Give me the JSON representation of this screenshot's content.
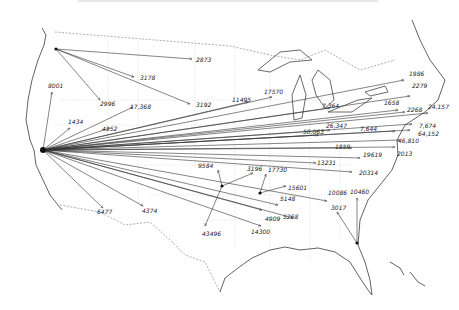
{
  "map": {
    "title": "",
    "description": "Hand-drawn flow map of the United States showing migration/shipment arrows from origins with numeric counts",
    "colors": {
      "ink": "#333333",
      "coast": "#3a3a3a",
      "state_lines": "#cfcfcf",
      "background": "#ffffff"
    },
    "origins": [
      {
        "name": "Seattle",
        "x": 56,
        "y": 49
      },
      {
        "name": "San Francisco",
        "x": 43,
        "y": 150
      },
      {
        "name": "Texas hub",
        "x": 222,
        "y": 186
      },
      {
        "name": "Memphis hub",
        "x": 260,
        "y": 193
      },
      {
        "name": "Florida hub",
        "x": 357,
        "y": 243
      }
    ],
    "flows": [
      {
        "from": 0,
        "to": [
          192,
          59
        ],
        "label": "2873",
        "lx": 196,
        "ly": 62
      },
      {
        "from": 0,
        "to": [
          134,
          77
        ],
        "label": "3178",
        "lx": 140,
        "ly": 80
      },
      {
        "from": 0,
        "to": [
          100,
          100
        ],
        "label": "2996",
        "lx": 100,
        "ly": 106
      },
      {
        "from": 0,
        "to": [
          190,
          104
        ],
        "label": "3192",
        "lx": 196,
        "ly": 107
      },
      {
        "from": 1,
        "to": [
          52,
          92
        ],
        "label": "8001",
        "lx": 48,
        "ly": 88
      },
      {
        "from": 1,
        "to": [
          70,
          128
        ],
        "label": "1434",
        "lx": 68,
        "ly": 124
      },
      {
        "from": 1,
        "to": [
          110,
          128
        ],
        "label": "4152",
        "lx": 102,
        "ly": 131
      },
      {
        "from": 1,
        "to": [
          133,
          107
        ],
        "label": "17,368",
        "lx": 130,
        "ly": 109
      },
      {
        "from": 1,
        "to": [
          248,
          102
        ],
        "label": "11495",
        "lx": 232,
        "ly": 102
      },
      {
        "from": 1,
        "to": [
          272,
          97
        ],
        "label": "17570",
        "lx": 264,
        "ly": 94
      },
      {
        "from": 1,
        "to": [
          330,
          108
        ],
        "label": "7,364",
        "lx": 322,
        "ly": 108
      },
      {
        "from": 1,
        "to": [
          404,
          80
        ],
        "label": "1986",
        "lx": 409,
        "ly": 76
      },
      {
        "from": 1,
        "to": [
          410,
          96
        ],
        "label": "2279",
        "lx": 412,
        "ly": 88
      },
      {
        "from": 1,
        "to": [
          398,
          110
        ],
        "label": "1658",
        "lx": 384,
        "ly": 105
      },
      {
        "from": 1,
        "to": [
          405,
          112
        ],
        "label": "2268",
        "lx": 407,
        "ly": 112
      },
      {
        "from": 1,
        "to": [
          428,
          113
        ],
        "label": "24,157",
        "lx": 428,
        "ly": 109
      },
      {
        "from": 1,
        "to": [
          412,
          124
        ],
        "label": "7,674",
        "lx": 419,
        "ly": 128
      },
      {
        "from": 1,
        "to": [
          410,
          130
        ],
        "label": "64,152",
        "lx": 418,
        "ly": 136
      },
      {
        "from": 1,
        "to": [
          395,
          131
        ],
        "label": "7,644",
        "lx": 360,
        "ly": 131
      },
      {
        "from": 1,
        "to": [
          400,
          140
        ],
        "label": "46,810",
        "lx": 398,
        "ly": 143
      },
      {
        "from": 1,
        "to": [
          330,
          130
        ],
        "label": "26,347",
        "lx": 326,
        "ly": 128
      },
      {
        "from": 1,
        "to": [
          318,
          135
        ],
        "label": "50,063",
        "lx": 303,
        "ly": 134
      },
      {
        "from": 1,
        "to": [
          395,
          147
        ],
        "label": "2013",
        "lx": 397,
        "ly": 156
      },
      {
        "from": 1,
        "to": [
          352,
          148
        ],
        "label": "1859",
        "lx": 335,
        "ly": 149
      },
      {
        "from": 1,
        "to": [
          360,
          158
        ],
        "label": "19619",
        "lx": 363,
        "ly": 157
      },
      {
        "from": 1,
        "to": [
          316,
          163
        ],
        "label": "13231",
        "lx": 317,
        "ly": 165
      },
      {
        "from": 1,
        "to": [
          352,
          172
        ],
        "label": "20314",
        "lx": 359,
        "ly": 175
      },
      {
        "from": 1,
        "to": [
          103,
          208
        ],
        "label": "6477",
        "lx": 97,
        "ly": 214
      },
      {
        "from": 1,
        "to": [
          143,
          206
        ],
        "label": "4374",
        "lx": 142,
        "ly": 213
      },
      {
        "from": 1,
        "to": [
          278,
          205
        ],
        "label": "5148",
        "lx": 280,
        "ly": 201
      },
      {
        "from": 1,
        "to": [
          293,
          218
        ],
        "label": "5268",
        "lx": 283,
        "ly": 219
      },
      {
        "from": 1,
        "to": [
          327,
          201
        ],
        "label": "10086",
        "lx": 328,
        "ly": 195
      },
      {
        "from": 1,
        "to": [
          262,
          210
        ],
        "label": "4909",
        "lx": 265,
        "ly": 221
      },
      {
        "from": 1,
        "to": [
          261,
          226
        ],
        "label": "14300",
        "lx": 251,
        "ly": 234
      },
      {
        "from": 2,
        "to": [
          218,
          170
        ],
        "label": "9584",
        "lx": 198,
        "ly": 168
      },
      {
        "from": 2,
        "to": [
          205,
          226
        ],
        "label": "43496",
        "lx": 202,
        "ly": 236
      },
      {
        "from": 2,
        "to": [
          253,
          173
        ],
        "label": "3196",
        "lx": 247,
        "ly": 171
      },
      {
        "from": 3,
        "to": [
          266,
          174
        ],
        "label": "17730",
        "lx": 268,
        "ly": 172
      },
      {
        "from": 3,
        "to": [
          286,
          186
        ],
        "label": "15601",
        "lx": 288,
        "ly": 190
      },
      {
        "from": 4,
        "to": [
          357,
          198
        ],
        "label": "10460",
        "lx": 350,
        "ly": 194
      },
      {
        "from": 4,
        "to": [
          337,
          212
        ],
        "label": "3017",
        "lx": 331,
        "ly": 210
      }
    ]
  }
}
